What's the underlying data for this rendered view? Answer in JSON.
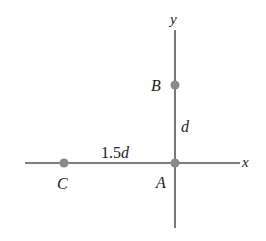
{
  "diagram": {
    "axes": {
      "x_label": "x",
      "y_label": "y",
      "color": "#555555"
    },
    "points": [
      {
        "id": "A",
        "label": "A",
        "color": "#8a8a8a"
      },
      {
        "id": "B",
        "label": "B",
        "color": "#8a8a8a"
      },
      {
        "id": "C",
        "label": "C",
        "color": "#8a8a8a"
      }
    ],
    "distances": {
      "AB_number": "",
      "AB_var": "d",
      "AC_number": "1.5",
      "AC_var": "d"
    }
  }
}
